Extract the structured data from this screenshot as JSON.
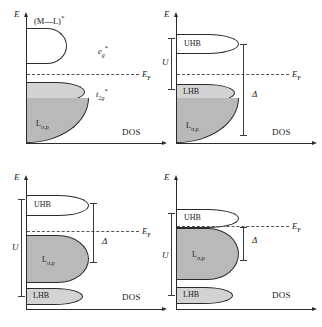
{
  "figure": {
    "caption_fragment": "",
    "background": "#ffffff",
    "ink": "#2b2b2b",
    "fill_light": "#d3d3d3",
    "fill_dark": "#b9b9b9",
    "fill_empty": "#ffffff"
  },
  "common": {
    "energy_axis_label": "E",
    "dos_axis_label": "DOS",
    "fermi_label": "E",
    "fermi_sub": "F",
    "coulomb_label": "U",
    "charge_transfer_label": "Δ"
  },
  "panels": [
    {
      "id": "panel-a",
      "position": "top-left",
      "title": "(M—L)",
      "title_sup": "*",
      "orbitals": [
        {
          "name": "eg-star",
          "label": "e",
          "sub": "g",
          "sup": "*"
        },
        {
          "name": "t2g-star",
          "label": "t",
          "sub": "2g",
          "sup": "*"
        }
      ],
      "bands": [
        {
          "name": "eg-star-band",
          "label": "",
          "fill": "empty"
        },
        {
          "name": "t2g-star-band",
          "label": "",
          "fill": "light"
        },
        {
          "name": "ligand-p-band",
          "label": "L",
          "sub": "σ,p",
          "fill": "dark"
        }
      ],
      "brackets": []
    },
    {
      "id": "panel-b",
      "position": "top-right",
      "title": "",
      "orbitals": [],
      "bands": [
        {
          "name": "uhb-band",
          "label": "UHB",
          "fill": "empty"
        },
        {
          "name": "lhb-band",
          "label": "LHB",
          "fill": "light"
        },
        {
          "name": "ligand-p-band",
          "label": "L",
          "sub": "σ,p",
          "fill": "dark"
        }
      ],
      "brackets": [
        {
          "name": "u-bracket",
          "label": "U"
        },
        {
          "name": "delta-bracket",
          "label": "Δ"
        }
      ]
    },
    {
      "id": "panel-c",
      "position": "bottom-left",
      "title": "",
      "orbitals": [],
      "bands": [
        {
          "name": "uhb-band",
          "label": "UHB",
          "fill": "empty"
        },
        {
          "name": "ligand-p-band",
          "label": "L",
          "sub": "σ,p",
          "fill": "dark"
        },
        {
          "name": "lhb-band",
          "label": "LHB",
          "fill": "light"
        }
      ],
      "brackets": [
        {
          "name": "u-bracket",
          "label": "U"
        },
        {
          "name": "delta-bracket",
          "label": "Δ"
        }
      ]
    },
    {
      "id": "panel-d",
      "position": "bottom-right",
      "title": "",
      "orbitals": [],
      "bands": [
        {
          "name": "uhb-band",
          "label": "UHB",
          "fill": "empty"
        },
        {
          "name": "ligand-p-band",
          "label": "L",
          "sub": "σ,p",
          "fill": "dark"
        },
        {
          "name": "lhb-band",
          "label": "LHB",
          "fill": "light"
        }
      ],
      "brackets": [
        {
          "name": "u-bracket",
          "label": "U"
        },
        {
          "name": "delta-bracket",
          "label": "Δ"
        }
      ]
    }
  ]
}
